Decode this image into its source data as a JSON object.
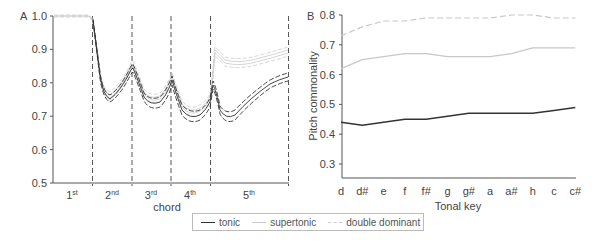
{
  "chart_data": [
    {
      "type": "line",
      "panel_label": "A",
      "title": "",
      "xlabel": "chord",
      "ylabel": "",
      "ylim": [
        0.5,
        1.0
      ],
      "yticks": [
        "1.0",
        "0.9",
        "0.8",
        "0.7",
        "0.6",
        "0.5"
      ],
      "x_segments": [
        "1st",
        "2nd",
        "3rd",
        "4th",
        "5th"
      ],
      "segment_dividers": "dashed vertical lines between chords",
      "series": [
        {
          "name": "tonic",
          "description": "mean with dashed confidence bands",
          "values_at_segment_ends": [
            1.0,
            0.84,
            0.8,
            0.76,
            0.83
          ],
          "minima": [
            null,
            0.755,
            0.73,
            0.7,
            0.695
          ]
        },
        {
          "name": "supertonic",
          "values_at_segment_ends": [
            1.0,
            0.84,
            0.8,
            0.75,
            0.91
          ],
          "minima": [
            null,
            0.755,
            0.73,
            0.7,
            0.875
          ]
        },
        {
          "name": "double dominant",
          "values_at_segment_ends": [
            1.0,
            0.84,
            0.81,
            0.76,
            0.92
          ],
          "minima": [
            null,
            0.755,
            0.74,
            0.71,
            0.88
          ]
        }
      ],
      "grid": false
    },
    {
      "type": "line",
      "panel_label": "B",
      "title": "",
      "xlabel": "Tonal key",
      "ylabel": "Pitch commonality",
      "ylim": [
        0.3,
        0.8
      ],
      "yticks": [
        "0.8",
        "0.7",
        "0.6",
        "0.5",
        "0.4",
        "0.3"
      ],
      "categories": [
        "d",
        "d#",
        "e",
        "f",
        "f#",
        "g",
        "g#",
        "a",
        "a#",
        "h",
        "c",
        "c#"
      ],
      "series": [
        {
          "name": "tonic",
          "values": [
            0.44,
            0.43,
            0.44,
            0.45,
            0.45,
            0.46,
            0.47,
            0.47,
            0.47,
            0.47,
            0.48,
            0.49
          ]
        },
        {
          "name": "supertonic",
          "values": [
            0.62,
            0.65,
            0.66,
            0.67,
            0.67,
            0.66,
            0.66,
            0.66,
            0.67,
            0.69,
            0.69,
            0.69
          ]
        },
        {
          "name": "double dominant",
          "values": [
            0.73,
            0.76,
            0.78,
            0.78,
            0.79,
            0.79,
            0.79,
            0.79,
            0.8,
            0.8,
            0.79,
            0.79
          ]
        }
      ],
      "grid": false
    }
  ],
  "legend": {
    "position": "bottom-center",
    "items": [
      {
        "label": "tonic",
        "style": "solid dark"
      },
      {
        "label": "supertonic",
        "style": "solid light gray"
      },
      {
        "label": "double dominant",
        "style": "dashed light gray"
      }
    ]
  },
  "colors": {
    "tonic": "#333333",
    "supertonic": "#c8c8c8",
    "double_dominant": "#c8c8c8",
    "axis": "#555555"
  },
  "panelA": {
    "label": "A",
    "xlabel": "chord",
    "yticks": [
      "1.0",
      "0.9",
      "0.8",
      "0.7",
      "0.6",
      "0.5"
    ],
    "segments": [
      {
        "base": "1",
        "sup": "st"
      },
      {
        "base": "2",
        "sup": "nd"
      },
      {
        "base": "3",
        "sup": "rd"
      },
      {
        "base": "4",
        "sup": "th"
      },
      {
        "base": "5",
        "sup": "th"
      }
    ]
  },
  "panelB": {
    "label": "B",
    "xlabel": "Tonal key",
    "ylabel": "Pitch commonality",
    "yticks": [
      "0.8",
      "0.7",
      "0.6",
      "0.5",
      "0.4",
      "0.3"
    ],
    "xticks": [
      "d",
      "d#",
      "e",
      "f",
      "f#",
      "g",
      "g#",
      "a",
      "a#",
      "h",
      "c",
      "c#"
    ]
  }
}
